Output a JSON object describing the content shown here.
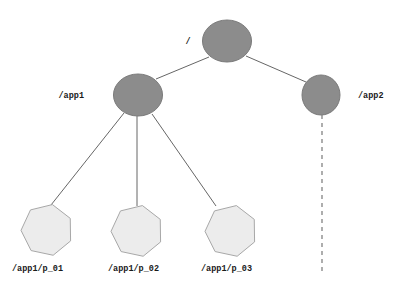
{
  "diagram": {
    "type": "tree-graph",
    "background_color": "#ffffff",
    "width": 401,
    "height": 289,
    "style": {
      "branch_node_fill": "#8c8c8c",
      "branch_node_stroke": "#7a7a7a",
      "leaf_node_fill": "#ececec",
      "leaf_node_stroke": "#a8a8a8",
      "edge_color": "#666666",
      "dashed_edge_color": "#8c8c8c",
      "label_color": "#1a1a1a"
    },
    "nodes": [
      {
        "id": "root",
        "label": "/",
        "shape": "ellipse",
        "cx": 227,
        "cy": 41,
        "rx": 24.5,
        "ry": 21,
        "fill": "#8c8c8c",
        "label_x": 188,
        "label_y": 44,
        "label_anchor": "middle"
      },
      {
        "id": "app1",
        "label": "/app1",
        "shape": "ellipse",
        "cx": 138,
        "cy": 95,
        "rx": 24.5,
        "ry": 21,
        "fill": "#8c8c8c",
        "label_x": 84,
        "label_y": 98,
        "label_anchor": "end"
      },
      {
        "id": "app2",
        "label": "/app2",
        "shape": "ellipse",
        "cx": 321,
        "cy": 95,
        "rx": 19,
        "ry": 20,
        "fill": "#8c8c8c",
        "label_x": 358,
        "label_y": 98,
        "label_anchor": "start"
      },
      {
        "id": "p01",
        "label": "/app1/p_01",
        "shape": "heptagon",
        "cx": 47,
        "cy": 230,
        "r": 26,
        "fill": "#ececec",
        "label_x": 12,
        "label_y": 271,
        "label_anchor": "start"
      },
      {
        "id": "p02",
        "label": "/app1/p_02",
        "shape": "heptagon",
        "cx": 137,
        "cy": 231,
        "r": 26,
        "fill": "#ececec",
        "label_x": 108,
        "label_y": 271,
        "label_anchor": "start"
      },
      {
        "id": "p03",
        "label": "/app1/p_03",
        "shape": "heptagon",
        "cx": 231,
        "cy": 231,
        "r": 26,
        "fill": "#ececec",
        "label_x": 201,
        "label_y": 271,
        "label_anchor": "start"
      }
    ],
    "edges": [
      {
        "id": "root-app1",
        "from": "root",
        "to": "app1",
        "style": "solid",
        "x1": 209,
        "y1": 57,
        "x2": 156,
        "y2": 79
      },
      {
        "id": "root-app2",
        "from": "root",
        "to": "app2",
        "style": "solid",
        "x1": 246,
        "y1": 56,
        "x2": 306,
        "y2": 82
      },
      {
        "id": "app1-p01",
        "from": "app1",
        "to": "p01",
        "style": "solid",
        "x1": 124,
        "y1": 113,
        "x2": 51,
        "y2": 205
      },
      {
        "id": "app1-p02",
        "from": "app1",
        "to": "p02",
        "style": "solid",
        "x1": 137,
        "y1": 116,
        "x2": 137,
        "y2": 206
      },
      {
        "id": "app1-p03",
        "from": "app1",
        "to": "p03",
        "style": "solid",
        "x1": 152,
        "y1": 114,
        "x2": 216,
        "y2": 206
      },
      {
        "id": "app2-dangling",
        "from": "app2",
        "to": null,
        "style": "dashed",
        "x1": 322,
        "y1": 115,
        "x2": 322,
        "y2": 272
      }
    ]
  }
}
